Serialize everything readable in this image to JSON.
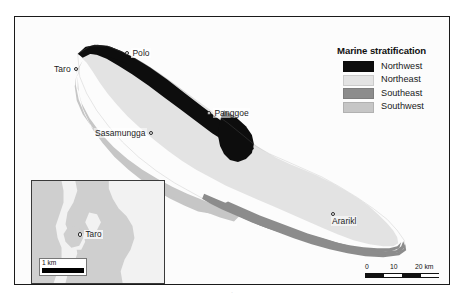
{
  "figure": {
    "type": "map",
    "region": "Choiseul Island, Solomon Islands"
  },
  "legend": {
    "title": "Marine stratification",
    "entries": [
      {
        "label": "Northwest",
        "color": "#0d0d0d"
      },
      {
        "label": "Northeast",
        "color": "#e3e3e3"
      },
      {
        "label": "Southeast",
        "color": "#8c8c8c"
      },
      {
        "label": "Southwest",
        "color": "#c6c6c6"
      }
    ]
  },
  "places": [
    {
      "name": "Taro",
      "label_side": "left"
    },
    {
      "name": "Polo",
      "label_side": "right"
    },
    {
      "name": "Panggoe",
      "label_side": "right"
    },
    {
      "name": "Sasamungga",
      "label_side": "left"
    },
    {
      "name": "Ararikl",
      "label_side": "stack"
    }
  ],
  "scalebar": {
    "ticks": [
      "0",
      "10",
      "20 km"
    ],
    "tick_0": "0",
    "tick_10": "10",
    "tick_20": "20 km"
  },
  "inset": {
    "place": "Taro",
    "scale_text": "1 km"
  },
  "colors": {
    "northwest": "#0d0d0d",
    "northeast": "#e3e3e3",
    "southeast": "#8c8c8c",
    "southwest": "#c6c6c6",
    "ocean": "#fcfcfc",
    "inset_land": "#cfcfcf",
    "inset_water": "#f2f2f2",
    "frame": "#1a1a1a"
  }
}
